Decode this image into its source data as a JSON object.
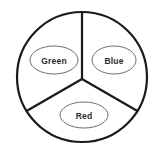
{
  "diagram": {
    "background_color": "#ffffff",
    "outer_circle": {
      "stroke_color": "#1a1a1a",
      "stroke_width": 2.2,
      "center_x": 82,
      "center_y": 77,
      "radius": 65
    },
    "dividers": {
      "stroke_color": "#1a1a1a",
      "stroke_width": 2.2,
      "junction_x": 82,
      "junction_y": 79,
      "count": 3,
      "angles_degrees": [
        90,
        210,
        330
      ]
    },
    "sectors": [
      {
        "id": "green-sector",
        "label": "Green",
        "label_color": "#2b2b2b",
        "ellipse": {
          "center_x": 54,
          "center_y": 60,
          "radius_x": 24,
          "radius_y": 14,
          "stroke_color": "#6e6e6e",
          "stroke_width": 1,
          "fill": "#ffffff"
        }
      },
      {
        "id": "blue-sector",
        "label": "Blue",
        "label_color": "#2b2b2b",
        "ellipse": {
          "center_x": 114,
          "center_y": 60,
          "radius_x": 22,
          "radius_y": 14,
          "stroke_color": "#6e6e6e",
          "stroke_width": 1,
          "fill": "#ffffff"
        }
      },
      {
        "id": "red-sector",
        "label": "Red",
        "label_color": "#2b2b2b",
        "ellipse": {
          "center_x": 84,
          "center_y": 115,
          "radius_x": 24,
          "radius_y": 13,
          "stroke_color": "#6e6e6e",
          "stroke_width": 1,
          "fill": "#ffffff"
        }
      }
    ]
  }
}
